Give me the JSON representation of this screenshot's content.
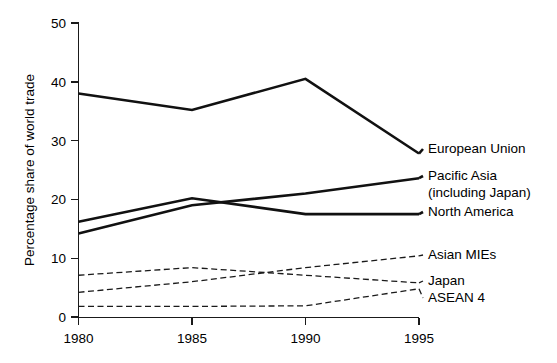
{
  "chart_data": {
    "type": "line",
    "title": "",
    "xlabel": "",
    "ylabel": "Percentage share of world trade",
    "x": [
      1980,
      1985,
      1990,
      1995
    ],
    "xtick_labels": [
      "1980",
      "1985",
      "1990",
      "1995"
    ],
    "ytick_labels": [
      "0",
      "10",
      "20",
      "30",
      "40",
      "50"
    ],
    "ytick_values": [
      0,
      10,
      20,
      30,
      40,
      50
    ],
    "ylim": [
      0,
      50
    ],
    "xlim": [
      1980,
      1995
    ],
    "grid": false,
    "legend_position": "right-inline-labels",
    "series": [
      {
        "name": "European Union",
        "style": "solid",
        "label": "European Union",
        "values": [
          38.0,
          35.2,
          40.5,
          27.8
        ]
      },
      {
        "name": "Pacific Asia (including Japan)",
        "style": "solid",
        "label": "Pacific Asia",
        "label_line2": "(including Japan)",
        "values": [
          14.2,
          19.0,
          21.0,
          23.6
        ]
      },
      {
        "name": "North America",
        "style": "solid",
        "label": "North America",
        "values": [
          16.2,
          20.2,
          17.5,
          17.5
        ]
      },
      {
        "name": "Asian MIEs",
        "style": "dashed",
        "label": "Asian MIEs",
        "values": [
          4.2,
          6.0,
          8.4,
          10.4
        ]
      },
      {
        "name": "Japan",
        "style": "dashed",
        "label": "Japan",
        "values": [
          7.1,
          8.4,
          7.1,
          5.8
        ]
      },
      {
        "name": "ASEAN 4",
        "style": "dashed",
        "label": "ASEAN 4",
        "values": [
          1.8,
          1.8,
          1.9,
          4.8
        ]
      }
    ]
  }
}
